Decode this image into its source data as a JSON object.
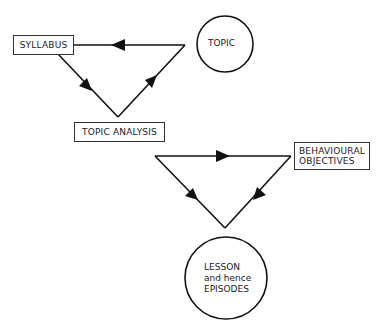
{
  "diagram": {
    "nodes": {
      "syllabus": "SYLLABUS",
      "topic": "TOPIC",
      "topic_analysis": "TOPIC ANALYSIS",
      "behavioural_objectives": [
        "BEHAVIOURAL",
        "OBJECTIVES"
      ],
      "lesson": [
        "LESSON",
        "and hence",
        "EPISODES"
      ]
    },
    "edges": [
      {
        "from": "topic",
        "to": "syllabus",
        "arrow": "left"
      },
      {
        "from": "syllabus",
        "to": "topic_analysis",
        "arrow": "down-right"
      },
      {
        "from": "topic_analysis",
        "to": "topic",
        "arrow": "up-right"
      },
      {
        "from": "topic_analysis",
        "to": "behavioural_objectives",
        "arrow": "right"
      },
      {
        "from": "behavioural_objectives",
        "to": "lesson",
        "arrow": "down-left"
      },
      {
        "from": "topic_analysis",
        "to": "lesson",
        "arrow": "down-right"
      }
    ],
    "colors": {
      "stroke": "#111111",
      "background": "#ffffff"
    }
  }
}
